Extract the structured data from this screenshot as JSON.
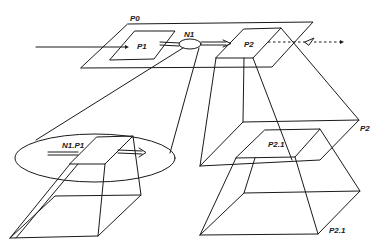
{
  "diagram": {
    "labels": {
      "p0": "P0",
      "p1": "P1",
      "n1": "N1",
      "p2": "P2",
      "n1p1": "N1.P1",
      "p2_inner": "P2.1",
      "p2_side": "P2",
      "p2_1_side": "P2.1"
    },
    "colors": {
      "stroke": "#1a1a1a",
      "background": "#ffffff"
    }
  }
}
